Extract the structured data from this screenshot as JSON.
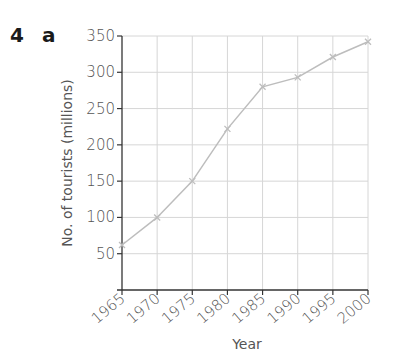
{
  "question": {
    "number": "4",
    "part": "a"
  },
  "chart_data": {
    "type": "line",
    "title": "",
    "xlabel": "Year",
    "ylabel": "No. of tourists (millions)",
    "x": [
      1965,
      1970,
      1975,
      1980,
      1985,
      1990,
      1995,
      2000
    ],
    "categories": [
      "1965",
      "1970",
      "1975",
      "1980",
      "1985",
      "1990",
      "1995",
      "2000"
    ],
    "series": [
      {
        "name": "Tourists",
        "values": [
          62,
          100,
          150,
          222,
          280,
          293,
          321,
          342
        ]
      }
    ],
    "yticks": [
      50,
      100,
      150,
      200,
      250,
      300,
      350
    ],
    "ylim": [
      0,
      350
    ],
    "xlim": [
      1965,
      2000
    ],
    "grid": true,
    "legend": "none",
    "colors": {
      "line": "#bdbdbd",
      "grid": "#d6d6d6",
      "axis": "#333333",
      "text": "#555555"
    }
  }
}
